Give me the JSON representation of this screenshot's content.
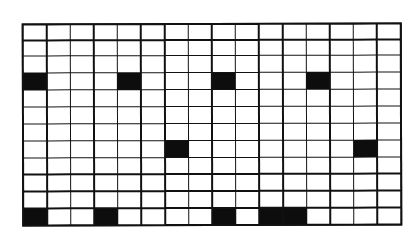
{
  "diagram": {
    "type": "grid-pattern",
    "rows": 12,
    "cols": 16,
    "colors": {
      "line": "#111111",
      "filled": "#0d0d0d",
      "empty": "#ffffff"
    },
    "filled_cells": [
      {
        "row": 3,
        "col": 0
      },
      {
        "row": 3,
        "col": 4
      },
      {
        "row": 3,
        "col": 8
      },
      {
        "row": 3,
        "col": 12
      },
      {
        "row": 7,
        "col": 6
      },
      {
        "row": 7,
        "col": 14
      },
      {
        "row": 11,
        "col": 0
      },
      {
        "row": 11,
        "col": 3
      },
      {
        "row": 11,
        "col": 8
      },
      {
        "row": 11,
        "col": 10
      },
      {
        "row": 11,
        "col": 11
      }
    ]
  }
}
